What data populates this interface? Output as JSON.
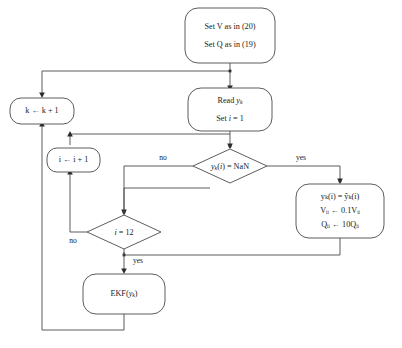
{
  "diagram": {
    "background_color": "#ffffff",
    "line_color": "#4a4a4a",
    "text_color": "#1a1a1a",
    "nodes": {
      "init": {
        "shape": "rounded-rectangle",
        "line1": "Set V as in (20)",
        "line2": "Set Q as in (19)"
      },
      "read": {
        "shape": "rounded-rectangle",
        "line1_prefix": "Read ",
        "line1_var": "y",
        "line1_sub": "k",
        "line2_prefix": "Set ",
        "line2_var": "i",
        "line2_suffix": " = 1"
      },
      "k_increment": {
        "shape": "rounded-rectangle",
        "var": "k",
        "text": "k ← k + 1"
      },
      "i_increment": {
        "shape": "rounded-rectangle",
        "var": "i",
        "text": "i ← i + 1"
      },
      "nan_test": {
        "shape": "diamond",
        "var": "y",
        "sub": "k",
        "arg": "i",
        "text": "yₖ(i) = NaN",
        "suffix": ") = NaN"
      },
      "substitute": {
        "shape": "rounded-rectangle",
        "line1": "yₖ(i) = ŷₖ(i)",
        "line2": "Vᵢᵢ ← 0.1Vᵢᵢ",
        "line3": "Qᵢᵢ ← 10Qᵢᵢ"
      },
      "count_test": {
        "shape": "diamond",
        "var": "i",
        "text": "i = 12",
        "suffix": " = 12"
      },
      "ekf": {
        "shape": "rounded-rectangle",
        "prefix": "EKF(",
        "var": "y",
        "sub": "k",
        "suffix": ")"
      }
    },
    "edge_labels": {
      "nan_no": "no",
      "nan_yes": "yes",
      "count_no": "no",
      "count_yes": "yes"
    }
  }
}
